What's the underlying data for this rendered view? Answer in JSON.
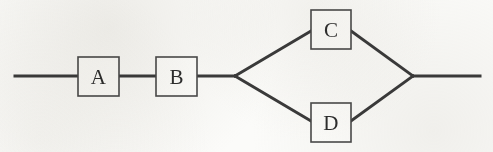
{
  "diagram": {
    "type": "block-network",
    "canvas": {
      "width": 493,
      "height": 152,
      "background": "#fbfbf9"
    },
    "style": {
      "wire_color": "#3b3b3b",
      "wire_width": 3,
      "box_stroke": "#4a4a4a",
      "box_fill": "#fdfdfb",
      "label_color": "#2e2e2e"
    },
    "baseline_y": 76,
    "nodes": [
      {
        "id": "A",
        "label": "A",
        "x": 78,
        "y": 57,
        "width": 41,
        "height": 39,
        "cx": 98.5,
        "cy": 76.5
      },
      {
        "id": "B",
        "label": "B",
        "x": 156,
        "y": 57,
        "width": 41,
        "height": 39,
        "cx": 176.5,
        "cy": 76.5
      },
      {
        "id": "C",
        "label": "C",
        "x": 311,
        "y": 10,
        "width": 40,
        "height": 39,
        "cx": 331,
        "cy": 29.5
      },
      {
        "id": "D",
        "label": "D",
        "x": 311,
        "y": 103,
        "width": 40,
        "height": 39,
        "cx": 331,
        "cy": 122.5
      }
    ],
    "junctions": [
      {
        "id": "split",
        "x": 235,
        "y": 76
      },
      {
        "id": "merge",
        "x": 413,
        "y": 76
      }
    ],
    "terminals": [
      {
        "id": "left-terminal",
        "x": 15,
        "y": 76
      },
      {
        "id": "right-terminal",
        "x": 480,
        "y": 76
      }
    ],
    "edges": [
      {
        "id": "wire-in-to-a",
        "from": "left-terminal",
        "to": "A",
        "path": "M 15 76 L 78 76"
      },
      {
        "id": "wire-a-to-b",
        "from": "A",
        "to": "B",
        "path": "M 119 76 L 156 76"
      },
      {
        "id": "wire-b-to-split",
        "from": "B",
        "to": "split",
        "path": "M 197 76 L 235 76"
      },
      {
        "id": "wire-split-to-c",
        "from": "split",
        "to": "C",
        "path": "M 235 76 L 311 31"
      },
      {
        "id": "wire-split-to-d",
        "from": "split",
        "to": "D",
        "path": "M 235 76 L 311 121"
      },
      {
        "id": "wire-c-to-merge",
        "from": "C",
        "to": "merge",
        "path": "M 351 31 L 413 76"
      },
      {
        "id": "wire-d-to-merge",
        "from": "D",
        "to": "merge",
        "path": "M 351 121 L 413 76"
      },
      {
        "id": "wire-merge-to-out",
        "from": "merge",
        "to": "right-terminal",
        "path": "M 413 76 L 480 76"
      }
    ]
  }
}
